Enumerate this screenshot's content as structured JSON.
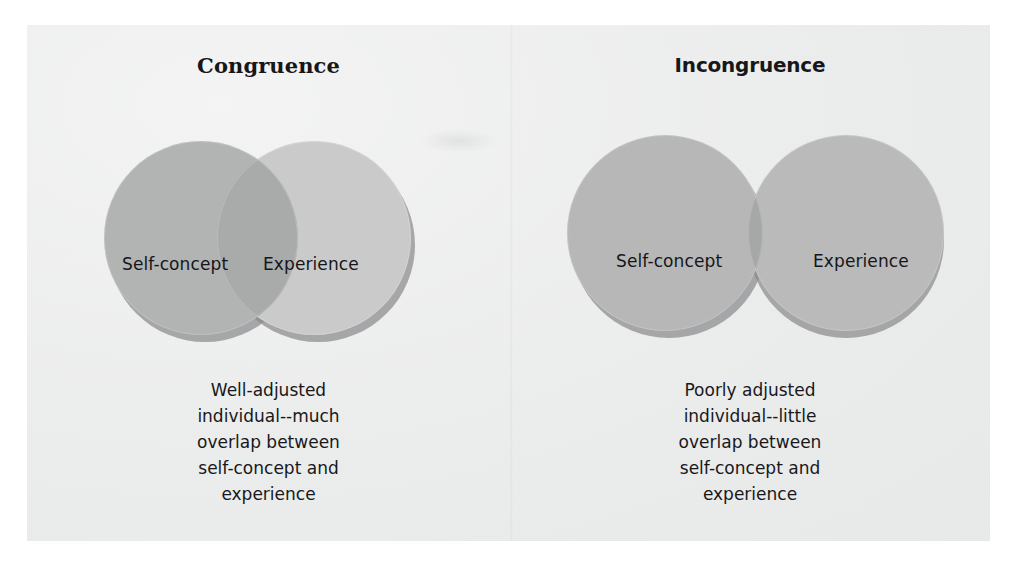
{
  "figure": {
    "background_color": "#f0f1f0",
    "page_color": "#ffffff",
    "topic": "Rogers' concepts of congruence and incongruence between self-concept and experience"
  },
  "panels": [
    {
      "id": "congruence",
      "title": "Congruence",
      "circles": [
        {
          "id": "self-concept",
          "label": "Self-concept",
          "fill": "#b2b3b3"
        },
        {
          "id": "experience",
          "label": "Experience",
          "fill": "#c9cac9"
        }
      ],
      "overlap": {
        "fill": "#a9aaaa",
        "amount": "much"
      },
      "shadow_color": "#8a8b8d",
      "caption_lines": [
        "Well-adjusted",
        "individual--much",
        "overlap between",
        "self-concept and",
        "experience"
      ]
    },
    {
      "id": "incongruence",
      "title": "Incongruence",
      "circles": [
        {
          "id": "self-concept",
          "label": "Self-concept",
          "fill": "#b6b7b6"
        },
        {
          "id": "experience",
          "label": "Experience",
          "fill": "#b9bab9"
        }
      ],
      "overlap": {
        "fill": "#a6a7a7",
        "amount": "little"
      },
      "shadow_color": "#8a8b8d",
      "caption_lines": [
        "Poorly adjusted",
        "individual--little",
        "overlap between",
        "self-concept and",
        "experience"
      ]
    }
  ]
}
